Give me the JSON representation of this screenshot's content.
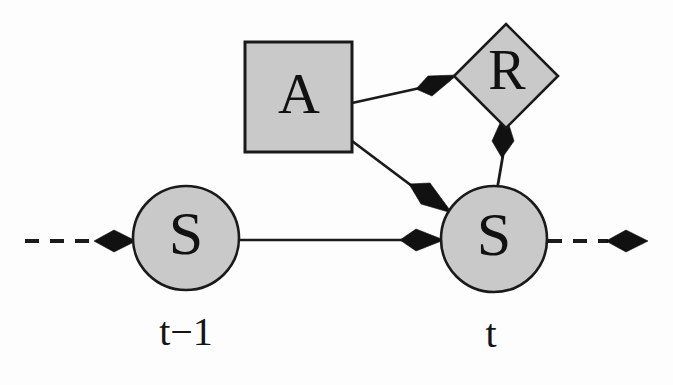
{
  "diagram": {
    "background_color": "#fdfdfd",
    "node_fill_color": "#c9c9c9",
    "node_stroke_color": "#1a1a1a",
    "edge_color": "#1b1b1b",
    "arrowhead_color": "#111111",
    "nodes": [
      {
        "id": "state-prev",
        "label": "S",
        "shape": "ellipse",
        "cx": 186,
        "cy": 238,
        "rx": 53,
        "ry": 52,
        "font_size": 62
      },
      {
        "id": "action",
        "label": "A",
        "shape": "rectangle",
        "x": 245,
        "y": 42,
        "width": 107,
        "height": 110,
        "font_size": 58
      },
      {
        "id": "reward",
        "label": "R",
        "shape": "diamond",
        "cx": 506,
        "cy": 76,
        "half_diagonal": 52,
        "font_size": 56
      },
      {
        "id": "state-curr",
        "label": "S",
        "shape": "ellipse",
        "cx": 494,
        "cy": 239,
        "rx": 53,
        "ry": 53,
        "font_size": 62
      }
    ],
    "edges": [
      {
        "id": "edge-state-prev-to-state-curr",
        "from": "state-prev",
        "to": "state-curr",
        "style": "solid",
        "arrowhead": "kite"
      },
      {
        "id": "edge-action-to-reward",
        "from": "action",
        "to": "reward",
        "style": "solid",
        "arrowhead": "kite"
      },
      {
        "id": "edge-action-to-state-curr",
        "from": "action",
        "to": "state-curr",
        "style": "solid",
        "arrowhead": "kite"
      },
      {
        "id": "edge-state-curr-to-reward",
        "from": "state-curr",
        "to": "reward",
        "style": "solid",
        "arrowhead": "kite"
      },
      {
        "id": "edge-incoming-dashed",
        "from": "past",
        "to": "state-prev",
        "style": "dashed",
        "arrowhead": "kite"
      },
      {
        "id": "edge-outgoing-dashed",
        "from": "state-curr",
        "to": "future",
        "style": "dashed",
        "arrowhead": "kite"
      }
    ],
    "time_labels": [
      {
        "id": "time-prev",
        "text": "t−1",
        "x": 186,
        "y": 336,
        "font_size": 40
      },
      {
        "id": "time-curr",
        "text": "t",
        "x": 491,
        "y": 338,
        "font_size": 40
      }
    ]
  }
}
